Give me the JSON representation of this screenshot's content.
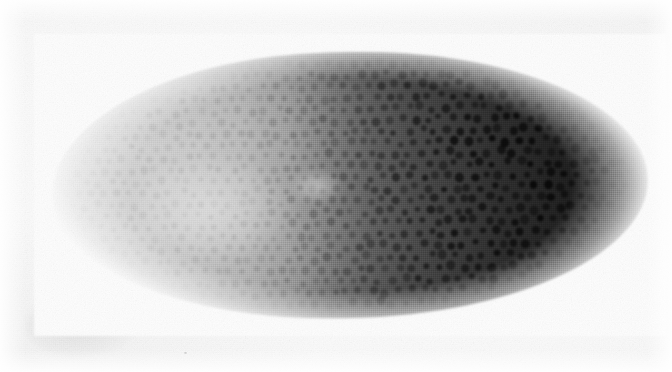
{
  "figure": {
    "kind": "light-micrograph",
    "stage_description": "syncytial blastoderm, surface nuclei visible as dots",
    "orientation": "anterior left, posterior right; dorsal up, ventral down",
    "view": "lateral whole-mount",
    "background_label": "white paper",
    "alt_text": "Grayscale micrograph of a Drosophila embryo in lateral view, showing an anterior-to-posterior gradient of dark staining with individual surface nuclei visible as dots.",
    "colors": {
      "paper": "#fdfdfd",
      "anterior_tone": "#d9d9d9",
      "midbody_tone": "#6a6a6a",
      "posterior_tone": "#1a1a1a",
      "nucleus_dark": "#161616",
      "nucleus_light": "#b4b4b4"
    },
    "embryo_bounds": {
      "x": 52,
      "y": 52,
      "width": 596,
      "height": 266,
      "rotation_deg": -1.2
    },
    "gradient_stops": [
      {
        "position_pct": 0,
        "tone": "#d9d9d9"
      },
      {
        "position_pct": 16,
        "tone": "#d2d2d2"
      },
      {
        "position_pct": 32,
        "tone": "#bdbdbd"
      },
      {
        "position_pct": 47,
        "tone": "#7c7c7c"
      },
      {
        "position_pct": 61,
        "tone": "#4a4a4a"
      },
      {
        "position_pct": 75,
        "tone": "#2e2e2e"
      },
      {
        "position_pct": 89,
        "tone": "#1d1d1d"
      },
      {
        "position_pct": 100,
        "tone": "#1c1c1c"
      }
    ],
    "nuclei": {
      "label": "surface nuclei",
      "approx_count": 760,
      "spacing_px": 13,
      "radius_px": 3.6,
      "description": "regularly spaced hexagonal-ish array of nuclei, contrast increasing toward the posterior"
    },
    "artifacts": [
      {
        "name": "paper-smudge",
        "x": 26,
        "y": 296,
        "width": 112,
        "height": 62
      },
      {
        "name": "paper-speck",
        "x": 252,
        "y": 320,
        "size": 2
      },
      {
        "name": "paper-speck",
        "x": 596,
        "y": 324,
        "size": 2
      },
      {
        "name": "paper-speck",
        "x": 558,
        "y": 66,
        "size": 2
      },
      {
        "name": "paper-speck",
        "x": 184,
        "y": 352,
        "size": 2
      }
    ]
  }
}
